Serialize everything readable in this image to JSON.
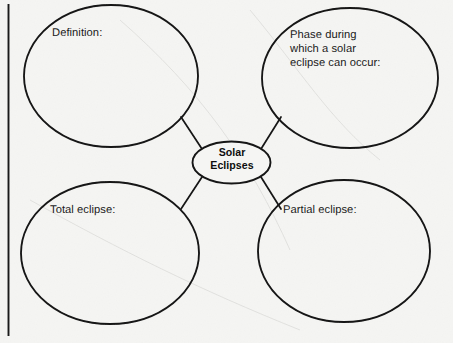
{
  "worksheet": {
    "type": "concept-web-graphic-organizer",
    "background_color": "#f5f5f3",
    "ink_color": "#111111",
    "margin_rule": {
      "name": "left-margin-rule",
      "orientation": "vertical",
      "color": "#1a1a1a"
    }
  },
  "center_node": {
    "label": "Solar\nEclipses",
    "line1": "Solar",
    "line2": "Eclipses",
    "bold": true
  },
  "nodes": [
    {
      "id": "definition",
      "label": "Definition:",
      "position": "top-left",
      "lines": [
        "Definition:"
      ]
    },
    {
      "id": "phase",
      "label": "Phase during\nwhich a solar\neclipse can occur:",
      "position": "top-right",
      "lines": [
        "Phase during",
        "which a solar",
        "eclipse can occur:"
      ]
    },
    {
      "id": "total-eclipse",
      "label": "Total eclipse:",
      "position": "bottom-left",
      "lines": [
        "Total eclipse:"
      ]
    },
    {
      "id": "partial-eclipse",
      "label": "Partial eclipse:",
      "position": "bottom-right",
      "lines": [
        "Partial eclipse:"
      ]
    }
  ],
  "connectors": [
    {
      "from": "center",
      "to": "definition"
    },
    {
      "from": "center",
      "to": "phase"
    },
    {
      "from": "center",
      "to": "total-eclipse"
    },
    {
      "from": "center",
      "to": "partial-eclipse"
    }
  ]
}
